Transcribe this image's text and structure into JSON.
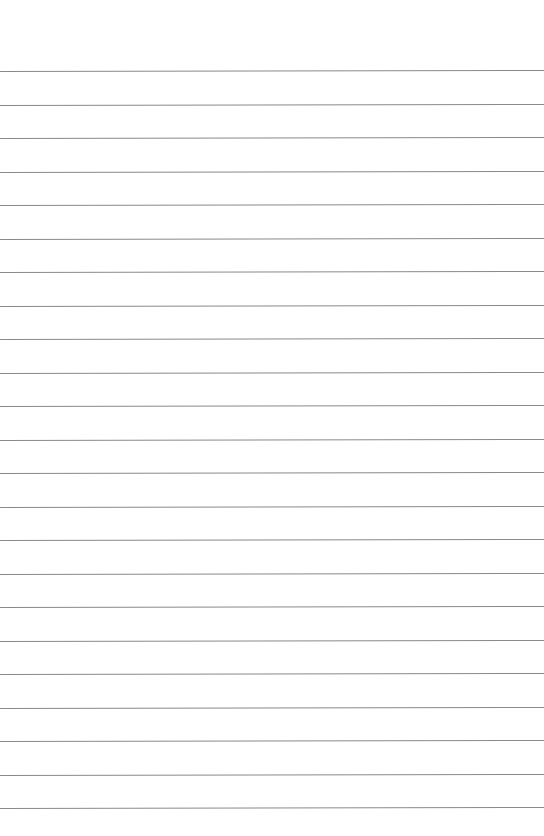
{
  "page": {
    "type": "lined-paper",
    "background_color": "#ffffff",
    "line_color": "#8a8a8a",
    "line_count": 23,
    "first_line_y": 71,
    "line_spacing": 33.5
  }
}
